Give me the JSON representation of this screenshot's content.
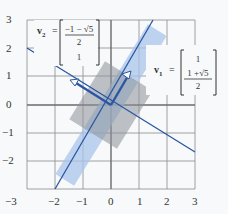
{
  "figure": {
    "x_ticks": [
      "−3",
      "−2",
      "−1",
      "0",
      "1",
      "2",
      "3"
    ],
    "y_ticks": [
      "3",
      "2",
      "1",
      "0",
      "−1",
      "−2"
    ],
    "v1": {
      "label": "v",
      "sub": "1",
      "eq": "=",
      "top": "1",
      "num": "1 +√5",
      "den": "2"
    },
    "v2": {
      "label": "v",
      "sub": "2",
      "eq": "=",
      "num": "−1 − √5",
      "den": "2",
      "bottom": "1"
    },
    "colors": {
      "line": "#2b56a3",
      "light_rect": "#a9c4ea",
      "dark_rect": "#8a8f96",
      "grid": "#7a7a7a"
    }
  }
}
